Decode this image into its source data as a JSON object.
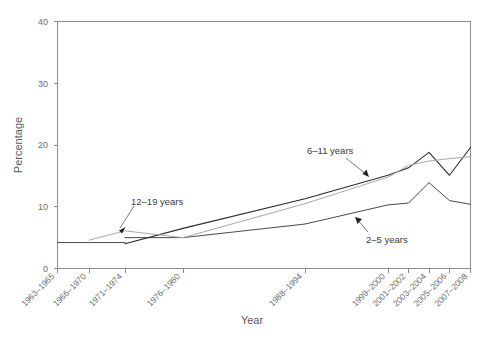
{
  "chart_data": {
    "type": "line",
    "title": "",
    "subtitle": "",
    "xlabel": "Year",
    "ylabel": "Percentage",
    "ylim": [
      0,
      40
    ],
    "yticks": [
      0,
      10,
      20,
      30,
      40
    ],
    "ytick_labels": [
      "0",
      "10",
      "20",
      "30",
      "40"
    ],
    "grid": false,
    "legend_position": "inline-annotations",
    "categories": [
      "1963–1965",
      "1966–1970",
      "1971–1974",
      "1976–1980",
      "1988–1994",
      "1999–2000",
      "2001–2002",
      "2003–2004",
      "2005–2006",
      "2007–2008"
    ],
    "xtick_labels": [
      "1963–1965",
      "1966–1970",
      "1971–1974",
      "1976–1980",
      "1988–1994",
      "1999–2000",
      "2001–2002",
      "2003–2004",
      "2005–2006",
      "2007–2008"
    ],
    "series": [
      {
        "name": "2–5 years",
        "color": "#2b2b2b",
        "x": [
          "1963–1965",
          "1966–1970",
          "1971–1974",
          "1976–1980",
          "1988–1994",
          "1999–2000",
          "2001–2002",
          "2003–2004",
          "2005–2006",
          "2007–2008"
        ],
        "values": [
          null,
          null,
          5.0,
          5.0,
          7.2,
          10.3,
          10.6,
          13.9,
          11.0,
          10.4
        ]
      },
      {
        "name": "6–11 years",
        "color": "#2b2b2b",
        "x": [
          "1963–1965",
          "1966–1970",
          "1971–1974",
          "1976–1980",
          "1988–1994",
          "1999–2000",
          "2001–2002",
          "2003–2004",
          "2005–2006",
          "2007–2008"
        ],
        "values": [
          4.2,
          null,
          4.0,
          6.5,
          11.3,
          15.1,
          16.3,
          18.8,
          15.1,
          19.6
        ]
      },
      {
        "name": "12–19 years",
        "color": "#a8a8a8",
        "x": [
          "1963–1965",
          "1966–1970",
          "1971–1974",
          "1976–1980",
          "1988–1994",
          "1999–2000",
          "2001–2002",
          "2003–2004",
          "2005–2006",
          "2007–2008"
        ],
        "values": [
          null,
          4.6,
          6.1,
          5.0,
          10.5,
          14.8,
          16.7,
          17.4,
          17.8,
          18.1
        ]
      }
    ],
    "annotations": [
      {
        "label": "12–19 years"
      },
      {
        "label": "6–11 years"
      },
      {
        "label": "2–5 years"
      }
    ]
  },
  "axes": {
    "y_title": "Percentage",
    "x_title": "Year",
    "y_tick_0": "0",
    "y_tick_1": "10",
    "y_tick_2": "20",
    "y_tick_3": "30",
    "y_tick_4": "40"
  },
  "xlabels": {
    "t0": "1963–1965",
    "t1": "1966–1970",
    "t2": "1971–1974",
    "t3": "1976–1980",
    "t4": "1988–1994",
    "t5": "1999–2000",
    "t6": "2001–2002",
    "t7": "2003–2004",
    "t8": "2005–2006",
    "t9": "2007–2008"
  },
  "annotations": {
    "a_12_19": "12–19 years",
    "a_6_11": "6–11 years",
    "a_2_5": "2–5 years"
  }
}
